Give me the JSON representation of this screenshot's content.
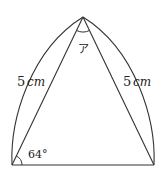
{
  "diagram": {
    "type": "geometry",
    "points": {
      "apex": [
        83,
        17
      ],
      "bottom_left": [
        12,
        165
      ],
      "bottom_right": [
        154,
        165
      ]
    },
    "labels": {
      "left_side_value": "5",
      "left_side_unit": "cm",
      "right_side_value": "5",
      "right_side_unit": "cm",
      "base_angle": "64°",
      "apex_angle": "ア"
    },
    "colors": {
      "stroke": "#333333",
      "background": "#ffffff"
    }
  }
}
